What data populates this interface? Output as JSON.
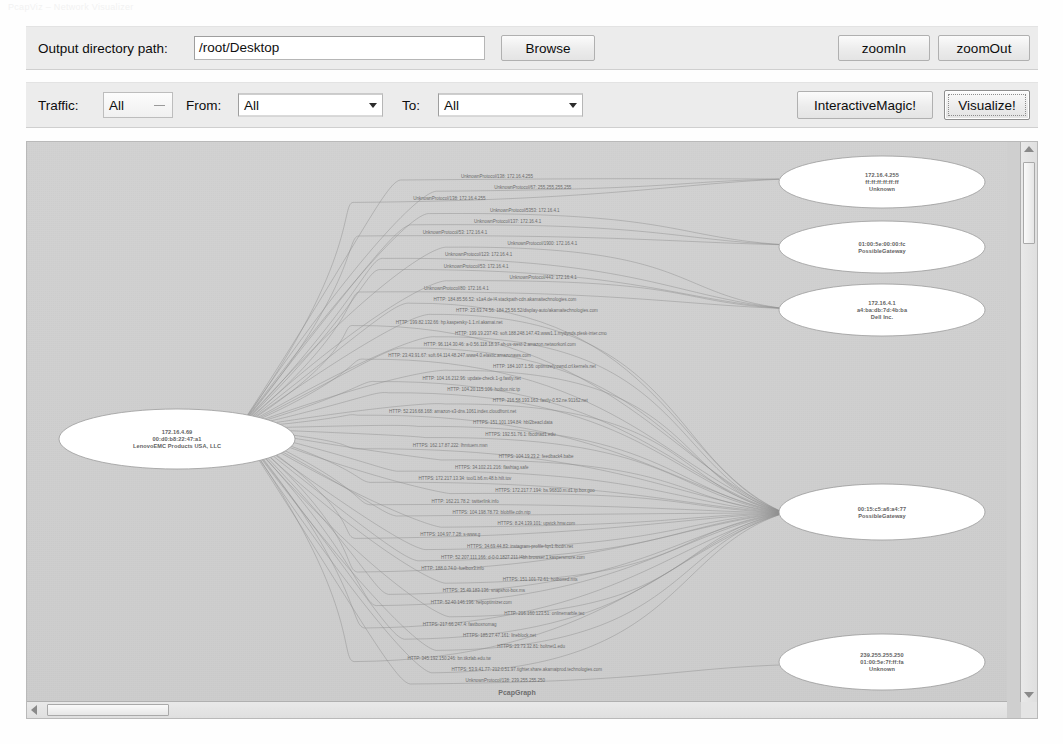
{
  "window": {
    "title_strip": "PcapViz  –  Network Visualizer"
  },
  "toolbar": {
    "output_label": "Output directory path:",
    "output_value": "/root/Desktop",
    "output_placeholder": "/root/Desktop",
    "browse_label": "Browse",
    "zoom_in_label": "zoomIn",
    "zoom_out_label": "zoomOut"
  },
  "filterbar": {
    "traffic_label": "Traffic:",
    "traffic_value": "All",
    "from_label": "From:",
    "from_value": "All",
    "to_label": "To:",
    "to_value": "All",
    "interactive_label": "InteractiveMagic!",
    "visualize_label": "Visualize!"
  },
  "graph": {
    "caption": "PcapGraph",
    "nodes": [
      {
        "id": "hub",
        "name": "host-lenovoemc",
        "cx": 150,
        "cy": 297,
        "rx": 118,
        "ry": 30,
        "lines": [
          "172.16.4.69",
          "00:d0:b8:22:47:a1",
          "LenovoEMC Products USA, LLC"
        ]
      },
      {
        "id": "n1",
        "name": "host-broadcast-unknown",
        "cx": 855,
        "cy": 40,
        "rx": 103,
        "ry": 26,
        "lines": [
          "172.16.4.255",
          "ff:ff:ff:ff:ff:ff",
          "Unknown"
        ]
      },
      {
        "id": "n2",
        "name": "host-gateway-top",
        "cx": 855,
        "cy": 105,
        "rx": 103,
        "ry": 26,
        "lines": [
          "01:00:5e:00:00:fc",
          "PossibleGateway"
        ]
      },
      {
        "id": "n3",
        "name": "host-dell",
        "cx": 855,
        "cy": 168,
        "rx": 103,
        "ry": 26,
        "lines": [
          "172.16.4.1",
          "a4:ba:db:7d:4b:ba",
          "Dell Inc."
        ]
      },
      {
        "id": "n4",
        "name": "host-gateway-main",
        "cx": 855,
        "cy": 370,
        "rx": 103,
        "ry": 28,
        "lines": [
          "00:15:c5:a6:a4:77",
          "PossibleGateway"
        ]
      },
      {
        "id": "n5",
        "name": "host-multicast-unknown",
        "cx": 855,
        "cy": 520,
        "rx": 103,
        "ry": 28,
        "lines": [
          "239.255.255.250",
          "01:00:5e:7f:ff:fa",
          "Unknown"
        ]
      }
    ],
    "edge_labels": [
      "UnknownProtocol/138: 172.16.4.255",
      "UnknownProtocol/67: 255.255.255.255",
      "UnknownProtocol/138: 172.16.4.255",
      "UnknownProtocol/5353: 172.16.4.1",
      "UnknownProtocol/137: 172.16.4.1",
      "UnknownProtocol/53: 172.16.4.1",
      "UnknownProtocol/1900: 172.16.4.1",
      "UnknownProtocol/123: 172.16.4.1",
      "UnknownProtocol/53: 172.16.4.1",
      "UnknownProtocol/443: 172.16.4.1",
      "UnknownProtocol/80: 172.16.4.1",
      "HTTP: 184.85.56.52: s1a4.de-l4.stackpath-cdn.akamaitechnologies.com",
      "HTTP: 23.63.74.56: 184.25.56.52/display-auto/akamaitechnologies.com",
      "HTTP: 199.82.132.66: hp.kaspersky-1.1.nl.akamai.net",
      "HTTP: 199.19.237.43: soft.188.248.147.43.www1.1.mydynds.plesk-inter.cmo",
      "HTTP: 96.114.30.46: a-0.56.118.18.37.sh-us-west-2.amazon.networkonl.com",
      "HTTP: 23.43.91.67: soft.64.114.48.247.www4.0.elastic.amazonaws.com",
      "HTTP: 184.107.1.56: optimizely.cwnd.crl.kernels.net",
      "HTTP: 104.16.212.96: update-check.1-g.fastly.net",
      "HTTP: 104.20.115.106: hotbox.nic.tp",
      "HTTP: 216.58.193.163: fastly-0.52.ne.91162.net",
      "HTTP: 52.216.68.168: amazon-s3-dns.1061.index.cloudfront.net",
      "HTTPS: 151.101.194.84: hbl2beacl.data",
      "HTTPS: 192.51.76.1: fbcdnad1.edu",
      "HTTPS: 162.17.87.222: lhmtuem.msn",
      "HTTPS: 104.19.23.2: feedback4.babe",
      "HTTPS: 34.102.21.216: flashtag.safe",
      "HTTPS: 172.217.13.34: tool1.b6.m.48.b.hilt.tov",
      "HTTPS: 172.217.7.194: bs.96810.m.d1.tp.box.goo",
      "HTTP: 162.21.78.2: twitterlink.info",
      "HTTPS: 104.198.78.73: blobfile.cdn.ntp",
      "HTTPS: 8.24.139.101: upstck.hnw.com",
      "HTTPS: 104.97.7.28: s-www.g",
      "HTTPS: 34.69.44.83: instagram-profile-fqn1.fbcdn.net",
      "HTTP: 52.207.111.166: d-0-0.1827.211.l4bh.browser.1.kaspersmore.com",
      "HTTP: 188.0.74.0: fuelbox3.info",
      "HTTPS: 151.101.72.61: hotboxed.mts",
      "HTTPS: 35.49.183.136: snapshot-box.ms",
      "HTTP: 52.40.146.196: helpoptimizer.com",
      "HTTP: 216.160.123.51: onlinemarble.tec",
      "HTTPS: 217.66.247.4: fastboxnomag",
      "HTTPS: 185.27.47.161: lineblock.net",
      "HTTPS: 23.73.32.81: boltnet1.edu",
      "HTTP: 345.192.150.246: bn.tikzlab.edu.tw",
      "HTTPS: 53.9.41.77: 212.0.51.97.tighter.share.akamaiprod.technologies.com",
      "UnknownProtocol/138: 239.255.255.250"
    ]
  }
}
